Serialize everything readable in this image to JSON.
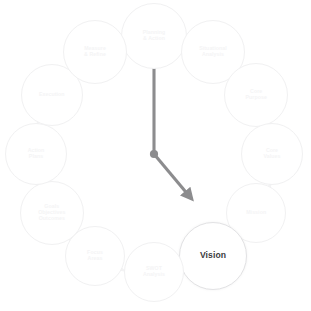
{
  "diagram": {
    "type": "circular-cycle",
    "center": {
      "x": 154,
      "y": 154
    },
    "radius": 118,
    "node_count": 12,
    "colors": {
      "background": "#ffffff",
      "node_ring_dim": "#f1f1f2",
      "node_ring_active": "#e2e2e4",
      "label_dim": "#f4f4f5",
      "label_active": "#3b3b3d",
      "connector_arrow": "#f3f3f4",
      "pointer_arrow": "#8c8c8e",
      "pivot_dot": "#8c8c8e"
    }
  },
  "nodes": [
    {
      "id": "planning-action",
      "label": "Planning\n& Action",
      "angle": -90,
      "radius": 33,
      "state": "dim"
    },
    {
      "id": "situational-analysis",
      "label": "Situational\nAnalysis",
      "angle": -60,
      "radius": 32,
      "state": "dim"
    },
    {
      "id": "core-purpose",
      "label": "Core\nPurpose",
      "angle": -30,
      "radius": 32,
      "state": "dim"
    },
    {
      "id": "core-values",
      "label": "Core\nValues",
      "angle": 0,
      "radius": 31,
      "state": "dim"
    },
    {
      "id": "mission",
      "label": "Mission",
      "angle": 30,
      "radius": 30,
      "state": "dim"
    },
    {
      "id": "vision",
      "label": "Vision",
      "angle": 60,
      "radius": 34,
      "state": "active"
    },
    {
      "id": "swot-analysis",
      "label": "SWOT\nAnalysis",
      "angle": 90,
      "radius": 30,
      "state": "dim"
    },
    {
      "id": "focus-areas",
      "label": "Focus\nAreas",
      "angle": 120,
      "radius": 30,
      "state": "dim"
    },
    {
      "id": "goals-objectives",
      "label": "Goals\nObjectives\nOutcomes",
      "angle": 150,
      "radius": 32,
      "state": "dim"
    },
    {
      "id": "action-plans",
      "label": "Action\nPlans",
      "angle": 180,
      "radius": 31,
      "state": "dim"
    },
    {
      "id": "execution",
      "label": "Execution",
      "angle": 210,
      "radius": 31,
      "state": "dim"
    },
    {
      "id": "measure-refine",
      "label": "Measure\n& Refine",
      "angle": 240,
      "radius": 32,
      "state": "dim"
    }
  ],
  "pointers": [
    {
      "id": "pointer-up",
      "target_node": "planning-action",
      "angle": -90,
      "length": 103,
      "label": "pointer to Planning & Action"
    },
    {
      "id": "pointer-down-right",
      "target_node": "vision",
      "angle": 50,
      "length": 58,
      "label": "pointer toward Vision"
    }
  ]
}
